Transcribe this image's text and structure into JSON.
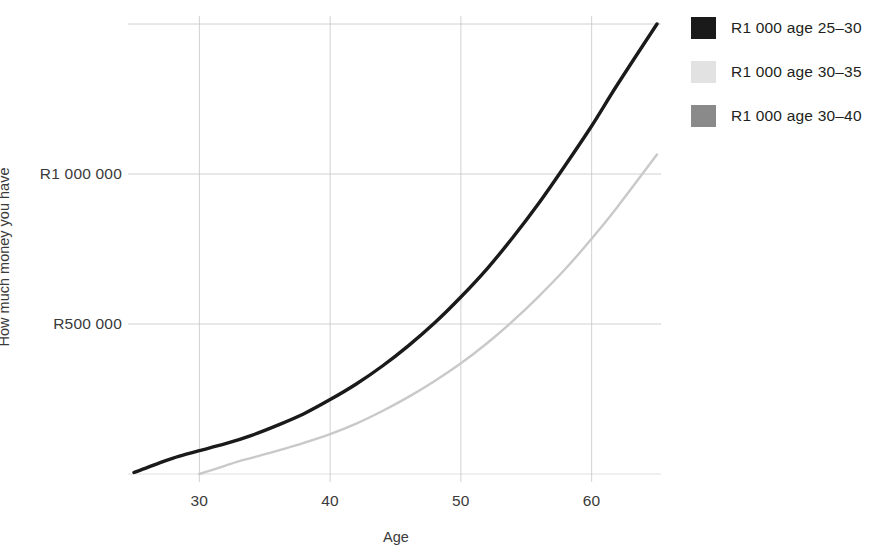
{
  "chart_data": {
    "type": "line",
    "title": "",
    "subtitle": "",
    "xlabel": "Age",
    "ylabel": "How much money you have",
    "xlim": [
      25,
      65
    ],
    "ylim": [
      0,
      1500000
    ],
    "grid": true,
    "legend_position": "right",
    "x_ticks": [
      {
        "value": 30,
        "label": "30"
      },
      {
        "value": 40,
        "label": "40"
      },
      {
        "value": 50,
        "label": "50"
      },
      {
        "value": 60,
        "label": "60"
      }
    ],
    "y_ticks": [
      {
        "value": 1000000,
        "label": "R1 000 000"
      },
      {
        "value": 500000,
        "label": "R500 000"
      }
    ],
    "currency_prefix": "R",
    "series": [
      {
        "name": "R1 000 age 25–30",
        "color": "#1a1a1a",
        "x": [
          25,
          26,
          27,
          28,
          29,
          30,
          32,
          34,
          36,
          38,
          40,
          42,
          44,
          46,
          48,
          50,
          52,
          54,
          56,
          58,
          60,
          62,
          65
        ],
        "values": [
          5000,
          21000,
          38000,
          53000,
          66000,
          78000,
          101000,
          129000,
          163000,
          201000,
          248000,
          300000,
          360000,
          428000,
          504000,
          590000,
          684000,
          790000,
          905000,
          1030000,
          1160000,
          1300000,
          1500000
        ]
      },
      {
        "name": "R1 000 age 30–35",
        "color": "#c9c9c9",
        "x": [
          30,
          31,
          32,
          33,
          34,
          36,
          38,
          40,
          42,
          44,
          46,
          48,
          50,
          52,
          54,
          56,
          58,
          60,
          62,
          65
        ],
        "values": [
          0,
          14000,
          28000,
          42000,
          54000,
          78000,
          104000,
          133000,
          168000,
          210000,
          257000,
          310000,
          369000,
          436000,
          511000,
          594000,
          684000,
          784000,
          892000,
          1065000
        ]
      },
      {
        "name": "R1 000 age 30–40",
        "color": "#8a8a8a",
        "x": [],
        "values": []
      }
    ],
    "annotations": []
  },
  "legend": {
    "items": [
      {
        "label": "R1 000 age 25–30",
        "color": "#1a1a1a"
      },
      {
        "label": "R1 000 age 30–35",
        "color": "#e2e2e2"
      },
      {
        "label": "R1 000 age 30–40",
        "color": "#8a8a8a"
      }
    ]
  },
  "axes": {
    "x_title": "Age",
    "y_title": "How much money you have",
    "x_tick_labels": [
      "30",
      "40",
      "50",
      "60"
    ],
    "y_tick_labels": [
      "R1 000 000",
      "R500 000"
    ]
  },
  "style": {
    "background": "#ffffff",
    "grid_color": "#c2c2c2",
    "text_color": "#231f20"
  }
}
